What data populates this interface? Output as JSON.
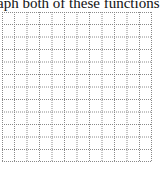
{
  "prompt": {
    "text": "aph both of these functions i"
  },
  "graph_grid": {
    "columns": 12,
    "rows": 12,
    "cell_size_px": 12.5,
    "line_style": "dotted",
    "line_color": "#8a8a8a"
  }
}
